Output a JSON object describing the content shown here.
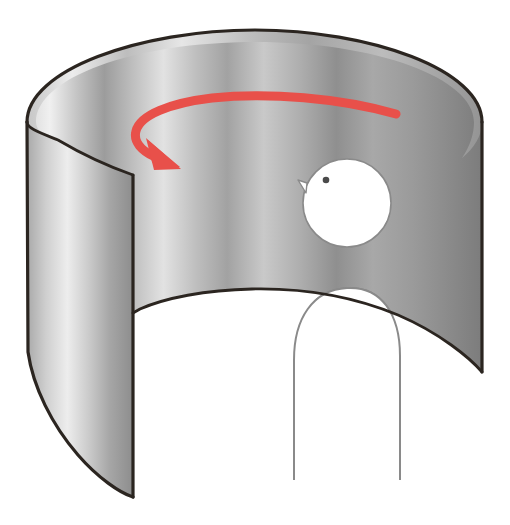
{
  "figure": {
    "title": "Rotating curved metal sheet with person silhouette",
    "background_color": "#ffffff",
    "caption": ""
  },
  "colors": {
    "metal_light": "#f2f2f2",
    "metal_mid": "#b9b9b9",
    "metal_dark": "#8e8e8e",
    "metal_darkest": "#707070",
    "outline": "#2b2520",
    "silhouette_fill": "#ffffff",
    "silhouette_stroke": "#8a8a8a",
    "arrow_red": "#e8504a",
    "eye_dot": "#4a4a4a"
  },
  "objects": {
    "cylinder": {
      "name": "curved-metal-sheet",
      "label": "Curved metal sheet",
      "top_rim_y": 30,
      "left_x": 27,
      "right_x": 482,
      "bottom_y": 497
    },
    "arrow": {
      "name": "rotation-arrow",
      "label": "Rotation direction arrow",
      "color": "#e8504a",
      "direction": "counter-clockwise",
      "start_x": 396,
      "start_y": 114,
      "head_x": 172,
      "head_y": 160
    },
    "silhouette": {
      "name": "person-silhouette",
      "label": "Person silhouette",
      "head_center_x": 347,
      "head_center_y": 203,
      "head_radius": 44,
      "eye_x": 326,
      "eye_y": 180,
      "nose_x": 301,
      "nose_y": 181
    }
  }
}
